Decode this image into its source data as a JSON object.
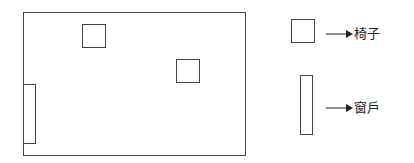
{
  "diagram": {
    "room": {
      "x": 23,
      "y": 12,
      "w": 223,
      "h": 144
    },
    "chairs": [
      {
        "x": 82,
        "y": 24,
        "w": 24,
        "h": 24
      },
      {
        "x": 176,
        "y": 59,
        "w": 24,
        "h": 24
      }
    ],
    "window": {
      "x": 23,
      "y": 84,
      "w": 13,
      "h": 60
    },
    "legend": [
      {
        "symbol": "chair",
        "label": "椅子"
      },
      {
        "symbol": "window",
        "label": "窗戶"
      }
    ]
  }
}
